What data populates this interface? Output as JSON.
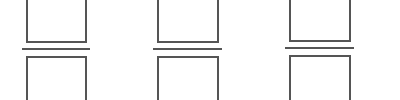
{
  "diagram": {
    "stroke_color": "#555555",
    "background": "#ffffff",
    "columns": [
      {
        "id": "column-1",
        "top_box": {
          "label": ""
        },
        "bottom_box": {
          "label": ""
        }
      },
      {
        "id": "column-2",
        "top_box": {
          "label": ""
        },
        "bottom_box": {
          "label": ""
        }
      },
      {
        "id": "column-3",
        "top_box": {
          "label": ""
        },
        "bottom_box": {
          "label": ""
        }
      }
    ]
  }
}
